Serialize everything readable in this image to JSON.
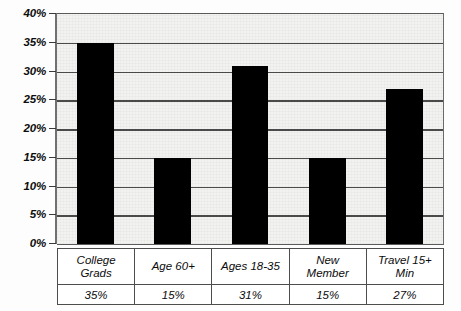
{
  "chart_data": {
    "type": "bar",
    "title": "",
    "subtitle": "",
    "xlabel": "",
    "ylabel": "",
    "ylim": [
      0,
      40
    ],
    "ytick_values": [
      40,
      35,
      30,
      25,
      20,
      15,
      10,
      5,
      0
    ],
    "ytick_labels": [
      "40%",
      "35%",
      "30%",
      "25%",
      "20%",
      "15%",
      "10%",
      "5%",
      "0%"
    ],
    "grid": true,
    "legend": "none",
    "categories": [
      "College Grads",
      "Age 60+",
      "Ages 18-35",
      "New Member",
      "Travel 15+ Min"
    ],
    "category_lines": [
      [
        "College",
        "Grads"
      ],
      [
        "Age 60+"
      ],
      [
        "Ages 18-35"
      ],
      [
        "New",
        "Member"
      ],
      [
        "Travel 15+",
        "Min"
      ]
    ],
    "values": [
      35,
      15,
      31,
      15,
      27
    ],
    "value_labels": [
      "35%",
      "15%",
      "31%",
      "15%",
      "27%"
    ],
    "bar_color": "#000000",
    "plot_background": "#f2f2f0",
    "gridline_color": "#4a4a4a"
  }
}
